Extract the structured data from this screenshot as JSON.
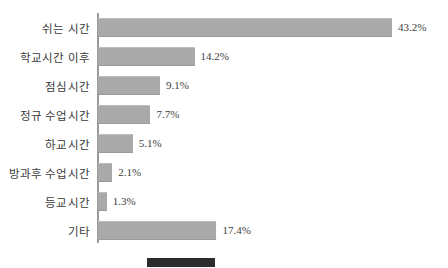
{
  "chart_data": {
    "type": "bar",
    "orientation": "horizontal",
    "title": "",
    "xlabel": "",
    "ylabel": "",
    "grid": false,
    "xlim": [
      0,
      43.2
    ],
    "unit": "%",
    "categories": [
      "쉬는 시간",
      "학교시간 이후",
      "점심시간",
      "정규 수업시간",
      "하교시간",
      "방과후 수업시간",
      "등교시간",
      "기타"
    ],
    "values": [
      43.2,
      14.2,
      9.1,
      7.7,
      5.1,
      2.1,
      1.3,
      17.4
    ],
    "value_labels": [
      "43.2%",
      "14.2%",
      "9.1%",
      "7.7%",
      "5.1%",
      "2.1%",
      "1.3%",
      "17.4%"
    ],
    "series": [
      {
        "name": "",
        "values": [
          43.2,
          14.2,
          9.1,
          7.7,
          5.1,
          2.1,
          1.3,
          17.4
        ],
        "color": "#a9a9a9"
      }
    ],
    "legend": {
      "position": "bottom",
      "swatch_color": "#2b2b2b",
      "label": ""
    }
  },
  "colors": {
    "bar": "#a9a9a9",
    "axis": "#9a9a9a",
    "text": "#3a3a3a",
    "legend_swatch": "#2b2b2b",
    "background": "#ffffff"
  }
}
